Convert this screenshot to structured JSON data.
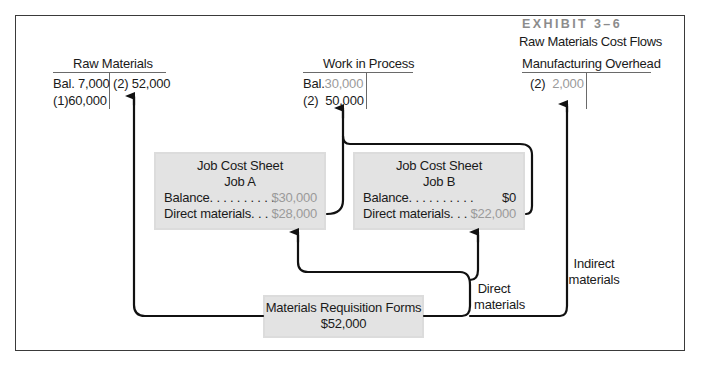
{
  "exhibit": {
    "label": "EXHIBIT 3–6",
    "title": "Raw Materials Cost Flows"
  },
  "t_accounts": {
    "raw_materials": {
      "title": "Raw Materials",
      "debit": [
        {
          "ref": "Bal.",
          "amount": "7,000"
        },
        {
          "ref": "(1)",
          "amount": "60,000"
        }
      ],
      "credit": [
        {
          "ref": "(2)",
          "amount": "52,000"
        }
      ]
    },
    "work_in_process": {
      "title": "Work in Process",
      "debit": [
        {
          "ref": "Bal.",
          "amount": "30,000"
        },
        {
          "ref": "(2)",
          "amount": "50,000"
        }
      ],
      "credit": []
    },
    "manufacturing_overhead": {
      "title": "Manufacturing Overhead",
      "debit": [
        {
          "ref": "(2)",
          "amount": "2,000"
        }
      ],
      "credit": []
    }
  },
  "job_cost_sheets": [
    {
      "title": "Job Cost Sheet",
      "job": "Job A",
      "rows": [
        {
          "label": "Balance. . . . . . . . . .",
          "value": "$30,000"
        },
        {
          "label": "Direct materials. . .",
          "value": "$28,000"
        }
      ]
    },
    {
      "title": "Job Cost Sheet",
      "job": "Job B",
      "rows": [
        {
          "label": "Balance. . . . . . . . . .",
          "value": "$0"
        },
        {
          "label": "Direct materials. . .",
          "value": "$22,000"
        }
      ]
    }
  ],
  "requisition": {
    "title": "Materials Requisition Forms",
    "amount": "$52,000"
  },
  "flow_labels": {
    "direct_line1": "Direct",
    "direct_line2": "materials",
    "indirect_line1": "Indirect",
    "indirect_line2": "materials"
  },
  "colors": {
    "box_fill": "#e3e3e3",
    "muted_text": "#9a9a9a",
    "arrow": "#111111"
  }
}
